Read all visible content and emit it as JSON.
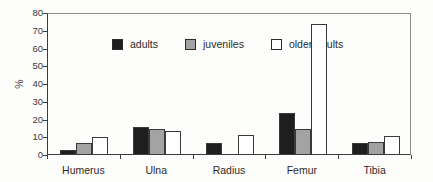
{
  "figure": {
    "ylabel": "%"
  },
  "chart_data": {
    "type": "bar",
    "title": "",
    "xlabel": "",
    "ylabel": "%",
    "ylim": [
      0,
      80
    ],
    "yticks": [
      0,
      10,
      20,
      30,
      40,
      50,
      60,
      70,
      80
    ],
    "grid": false,
    "legend_position": "top-left-inside",
    "categories": [
      "Humerus",
      "Ulna",
      "Radius",
      "Femur",
      "Tibia"
    ],
    "series": [
      {
        "name": "adults",
        "color": "#1e1e1e",
        "values": [
          2.5,
          15.5,
          6,
          23,
          6
        ]
      },
      {
        "name": "juveniles",
        "color": "#a3a3a3",
        "values": [
          6,
          14,
          0,
          14,
          6.5
        ]
      },
      {
        "name": "older adults",
        "color": "#ffffff",
        "values": [
          9.5,
          13,
          10.5,
          73,
          10
        ]
      }
    ]
  }
}
